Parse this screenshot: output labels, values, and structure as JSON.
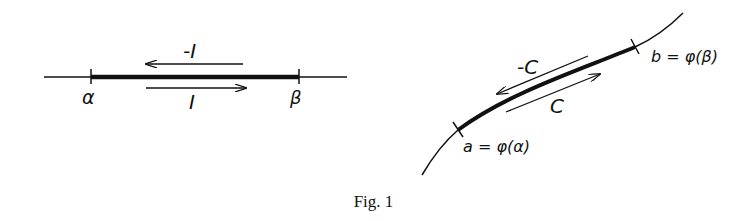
{
  "figure": {
    "caption": "Fig. 1",
    "colors": {
      "ink": "#111111",
      "background": "#ffffff"
    }
  },
  "left_diagram": {
    "description": "Real interval [alpha, beta] on a line with orientations I and -I",
    "endpoint_left": "α",
    "endpoint_right": "β",
    "forward_label": "I",
    "reverse_label": "-I"
  },
  "right_diagram": {
    "description": "Curve segment C from a to b, image of interval under phi",
    "start_point_label": "a = φ(α)",
    "end_point_label": "b = φ(β)",
    "forward_label": "C",
    "reverse_label": "-C"
  }
}
